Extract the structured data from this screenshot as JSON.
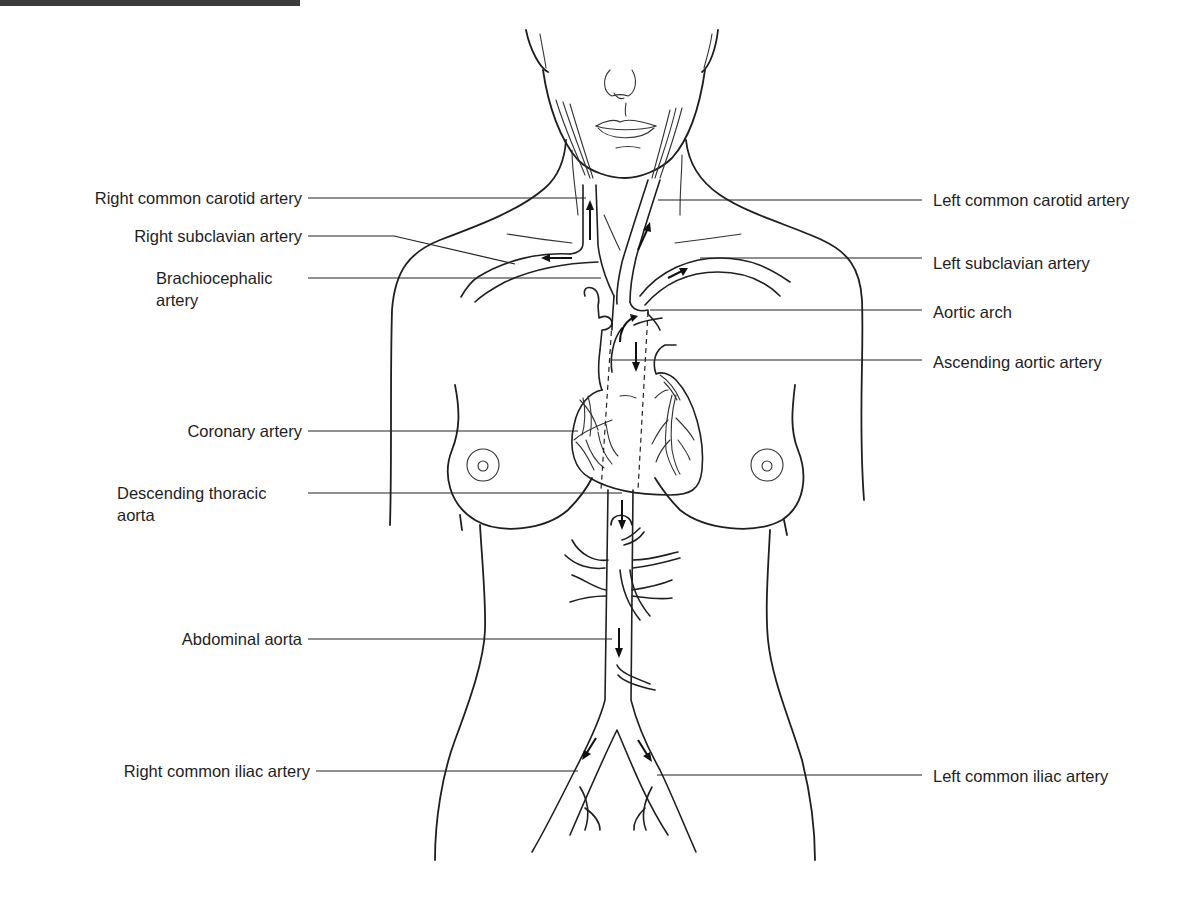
{
  "diagram": {
    "colors": {
      "line": "#1f1f1f",
      "text": "#1e1e1e",
      "background": "#ffffff"
    },
    "labels_left": [
      {
        "id": "right-common-carotid-artery",
        "text": "Right common carotid artery"
      },
      {
        "id": "right-subclavian-artery",
        "text": "Right subclavian artery"
      },
      {
        "id": "brachiocephalic-artery",
        "text": "Brachiocephalic artery"
      },
      {
        "id": "coronary-artery",
        "text": "Coronary artery"
      },
      {
        "id": "descending-thoracic-aorta",
        "text": "Descending thoracic aorta"
      },
      {
        "id": "abdominal-aorta",
        "text": "Abdominal aorta"
      },
      {
        "id": "right-common-iliac-artery",
        "text": "Right common iliac artery"
      }
    ],
    "labels_right": [
      {
        "id": "left-common-carotid-artery",
        "text": "Left common carotid artery"
      },
      {
        "id": "left-subclavian-artery",
        "text": "Left subclavian artery"
      },
      {
        "id": "aortic-arch",
        "text": "Aortic arch"
      },
      {
        "id": "ascending-aortic-artery",
        "text": "Ascending aortic artery"
      },
      {
        "id": "left-common-iliac-artery",
        "text": "Left common iliac artery"
      }
    ]
  }
}
